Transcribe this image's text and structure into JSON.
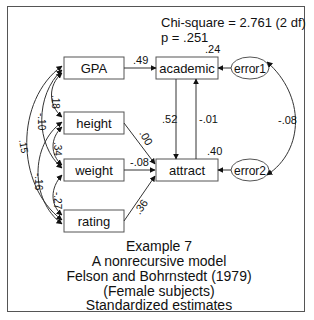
{
  "fit": {
    "chi_square_line": "Chi-square = 2.761 (2 df)",
    "p_line": "p = .251"
  },
  "nodes": {
    "gpa": "GPA",
    "height": "height",
    "weight": "weight",
    "rating": "rating",
    "academic": "academic",
    "attract": "attract",
    "error1": "error1",
    "error2": "error2"
  },
  "r_squared": {
    "academic": ".24",
    "attract": ".40"
  },
  "paths": {
    "gpa_academic": ".49",
    "height_attract": ".00",
    "weight_attract": "-.08",
    "rating_attract": ".36",
    "academic_attract": ".52",
    "attract_academic": "-.01"
  },
  "correlations": {
    "gpa_height": ".18",
    "gpa_weight": "-.10",
    "gpa_rating": ".15",
    "height_weight": ".34",
    "height_rating": "-.16",
    "weight_rating": "-.27",
    "error1_error2": "-.08"
  },
  "caption": {
    "line1": "Example 7",
    "line2": "A nonrecursive model",
    "line3": "Felson and Bohrnstedt (1979)",
    "line4": "(Female subjects)",
    "line5": "Standardized estimates"
  }
}
